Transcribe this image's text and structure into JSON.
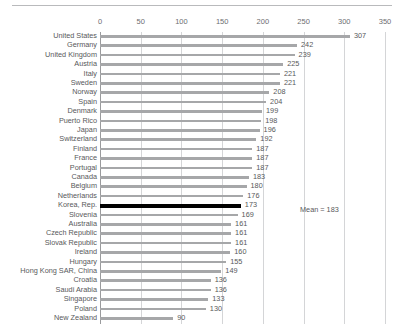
{
  "chart_data": {
    "type": "bar",
    "orientation": "horizontal",
    "title": "",
    "xlabel": "",
    "ylabel": "",
    "xlim": [
      0,
      350
    ],
    "xticks": [
      0,
      50,
      100,
      150,
      200,
      250,
      300,
      350
    ],
    "grid": true,
    "legend": null,
    "categories": [
      "United States",
      "Germany",
      "United Kingdom",
      "Austria",
      "Italy",
      "Sweden",
      "Norway",
      "Spain",
      "Denmark",
      "Puerto Rico",
      "Japan",
      "Switzerland",
      "Finland",
      "France",
      "Portugal",
      "Canada",
      "Belgium",
      "Netherlands",
      "Korea, Rep.",
      "Slovenia",
      "Australia",
      "Czech Republic",
      "Slovak Republic",
      "Ireland",
      "Hungary",
      "Hong Kong SAR, China",
      "Croatia",
      "Saudi Arabia",
      "Singapore",
      "Poland",
      "New Zealand"
    ],
    "values": [
      307,
      242,
      239,
      225,
      221,
      221,
      208,
      204,
      199,
      198,
      196,
      192,
      187,
      187,
      187,
      183,
      180,
      176,
      173,
      169,
      161,
      161,
      161,
      160,
      155,
      149,
      136,
      136,
      133,
      130,
      90
    ],
    "highlight_category": "Korea, Rep.",
    "annotations": [
      {
        "text": "Mean = 183",
        "name": "mean-annotation"
      }
    ],
    "colors": {
      "bar": "#a6a7a9",
      "bar_highlight": "#000000",
      "gridline": "#d4d5d7",
      "axis": "#9a9b9d",
      "text": "#58595b",
      "tick_text": "#6d6e71",
      "top_rule": "#b9babc"
    }
  }
}
